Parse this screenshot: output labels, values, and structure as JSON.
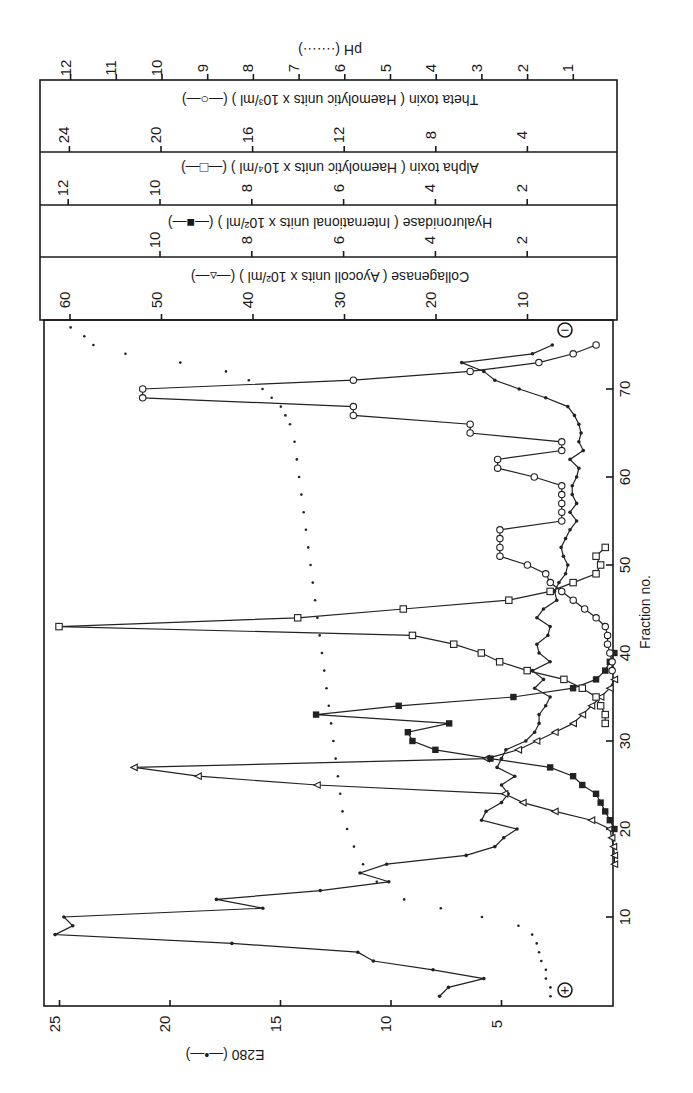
{
  "chart_data": {
    "type": "line",
    "orientation": "rotated-90-ccw",
    "title": "",
    "xlabel": "Fraction no.",
    "x_ticks": [
      10,
      20,
      30,
      40,
      50,
      60,
      70
    ],
    "xlim": [
      0,
      77
    ],
    "annotations": [
      {
        "text": "+",
        "shape": "circled",
        "position": "near fraction 2 (anode end)"
      },
      {
        "text": "−",
        "shape": "circled",
        "position": "near fraction 77 (cathode end)"
      }
    ],
    "axes": [
      {
        "id": "e280",
        "label": "E280 (—•—)",
        "ticks": [
          5,
          10,
          15,
          20,
          25
        ],
        "range": [
          0,
          25.5
        ]
      },
      {
        "id": "collagenase",
        "label": "Collagenase ( Ayocoll units x 10²/ml ) (—▵—)",
        "ticks": [
          10,
          20,
          30,
          40,
          50,
          60
        ]
      },
      {
        "id": "hyaluronidase",
        "label": "Hyaluronidase ( International units x 10²/ml ) (—■—)",
        "ticks": [
          2,
          4,
          6,
          8,
          10
        ]
      },
      {
        "id": "alpha",
        "label": "Alpha toxin ( Haemolytic units x 10⁴/ml ) (—□—)",
        "ticks": [
          2,
          4,
          6,
          8,
          10,
          12
        ]
      },
      {
        "id": "theta",
        "label": "Theta toxin ( Haemolytic units x 10³/ml ) (—○—)",
        "ticks": [
          4,
          8,
          12,
          16,
          20,
          24
        ]
      },
      {
        "id": "ph",
        "label": "pH (·······)",
        "ticks": [
          1,
          2,
          3,
          4,
          5,
          6,
          7,
          8,
          9,
          10,
          11,
          12
        ]
      }
    ],
    "series": [
      {
        "name": "E280",
        "axis": "e280",
        "marker": "dot",
        "x": [
          1,
          2,
          3,
          4,
          5,
          6,
          7,
          8,
          9,
          10,
          11,
          12,
          13,
          14,
          15,
          16,
          17,
          18,
          19,
          20,
          21,
          22,
          23,
          24,
          25,
          26,
          27,
          28,
          29,
          30,
          31,
          32,
          33,
          34,
          35,
          36,
          37,
          38,
          39,
          40,
          41,
          42,
          43,
          44,
          45,
          46,
          47,
          48,
          49,
          50,
          51,
          52,
          53,
          54,
          55,
          56,
          57,
          58,
          59,
          60,
          61,
          62,
          63,
          64,
          65,
          66,
          67,
          68,
          69,
          70,
          71,
          72,
          73,
          74,
          75
        ],
        "values": [
          7.8,
          7.4,
          5.8,
          8.1,
          10.8,
          11.5,
          17.2,
          25.2,
          24.4,
          24.8,
          15.8,
          17.9,
          13.2,
          10.1,
          11.4,
          10.2,
          6.6,
          5.3,
          4.9,
          4.3,
          5.9,
          5.7,
          5.0,
          4.7,
          5.0,
          4.4,
          5.2,
          5.0,
          4.8,
          3.9,
          3.5,
          3.3,
          3.3,
          3.0,
          2.8,
          3.5,
          3.1,
          3.6,
          2.8,
          3.3,
          3.4,
          2.9,
          2.8,
          3.4,
          3.1,
          2.5,
          2.6,
          2.4,
          2.1,
          2.0,
          2.2,
          2.3,
          2.1,
          1.9,
          1.6,
          1.9,
          1.6,
          1.8,
          1.8,
          1.6,
          1.5,
          1.9,
          1.3,
          1.5,
          1.4,
          1.5,
          1.7,
          2.0,
          3.0,
          4.2,
          5.3,
          5.8,
          6.8,
          3.6,
          2.7
        ]
      },
      {
        "name": "Collagenase",
        "axis": "collagenase",
        "marker": "open-triangle",
        "x": [
          16,
          17,
          18,
          19,
          20,
          21,
          22,
          23,
          24,
          25,
          26,
          27,
          28,
          29,
          30,
          31,
          32,
          33,
          34,
          35,
          36,
          37
        ],
        "values": [
          0.5,
          0.5,
          0.6,
          0.8,
          1.0,
          3.0,
          7.0,
          10.5,
          12.5,
          33.0,
          46.0,
          53.0,
          14.5,
          11.0,
          9.0,
          7.0,
          5.0,
          4.0,
          3.0,
          2.0,
          1.0,
          0.5
        ]
      },
      {
        "name": "Hyaluronidase",
        "axis": "hyaluronidase",
        "marker": "filled-square",
        "x": [
          20,
          21,
          22,
          23,
          24,
          25,
          26,
          27,
          28,
          29,
          30,
          31,
          32,
          33,
          34,
          35,
          36,
          37,
          38,
          39,
          40
        ],
        "values": [
          0.1,
          0.2,
          0.3,
          0.4,
          0.5,
          0.8,
          1.0,
          1.5,
          2.8,
          4.0,
          4.5,
          4.6,
          3.7,
          6.6,
          4.8,
          2.3,
          1.0,
          0.5,
          0.3,
          0.2,
          0.1
        ]
      },
      {
        "name": "Alpha toxin",
        "axis": "alpha",
        "marker": "open-square",
        "x": [
          32,
          33,
          34,
          35,
          36,
          37,
          38,
          39,
          40,
          41,
          42,
          43,
          44,
          45,
          46,
          47,
          48,
          49,
          50,
          51,
          52
        ],
        "values": [
          0.3,
          0.3,
          0.4,
          0.5,
          0.8,
          1.2,
          2.0,
          2.6,
          3.0,
          3.6,
          4.5,
          12.2,
          7.0,
          4.7,
          2.4,
          1.5,
          1.0,
          0.5,
          0.4,
          0.5,
          0.3
        ]
      },
      {
        "name": "Theta toxin",
        "axis": "theta",
        "marker": "open-circle",
        "x": [
          38,
          39,
          40,
          41,
          42,
          43,
          44,
          45,
          46,
          47,
          48,
          49,
          50,
          51,
          52,
          53,
          54,
          55,
          56,
          57,
          58,
          59,
          60,
          61,
          62,
          63,
          64,
          65,
          66,
          67,
          68,
          69,
          70,
          71,
          72,
          73,
          74,
          75
        ],
        "values": [
          0.3,
          0.3,
          0.4,
          0.5,
          0.5,
          0.6,
          1.0,
          1.5,
          2.0,
          2.5,
          3.0,
          3.2,
          4.0,
          5.2,
          5.2,
          5.2,
          5.2,
          2.5,
          2.5,
          2.5,
          2.5,
          2.5,
          3.7,
          5.3,
          5.3,
          2.5,
          2.5,
          6.5,
          6.5,
          11.6,
          11.6,
          20.8,
          20.8,
          11.6,
          6.5,
          3.5,
          2.0,
          1.0
        ]
      },
      {
        "name": "pH",
        "axis": "ph",
        "marker": "small-dot-no-line",
        "x": [
          1,
          2,
          3,
          4,
          5,
          6,
          7,
          8,
          9,
          10,
          11,
          12,
          14,
          16,
          18,
          20,
          22,
          24,
          26,
          28,
          30,
          32,
          34,
          36,
          38,
          40,
          42,
          44,
          46,
          48,
          50,
          52,
          54,
          56,
          58,
          60,
          62,
          64,
          66,
          67,
          68,
          69,
          70,
          71,
          72,
          73,
          74,
          75,
          76,
          77
        ],
        "values": [
          1.5,
          1.5,
          1.6,
          1.6,
          1.7,
          1.75,
          1.8,
          1.9,
          2.2,
          3.0,
          3.9,
          4.7,
          5.3,
          5.6,
          5.8,
          5.95,
          6.05,
          6.1,
          6.15,
          6.2,
          6.25,
          6.3,
          6.35,
          6.4,
          6.45,
          6.5,
          6.55,
          6.6,
          6.65,
          6.7,
          6.75,
          6.8,
          6.85,
          6.9,
          6.95,
          7.0,
          7.05,
          7.1,
          7.2,
          7.3,
          7.4,
          7.6,
          7.8,
          8.1,
          8.6,
          9.6,
          10.8,
          11.5,
          11.7,
          12.0
        ]
      }
    ]
  }
}
